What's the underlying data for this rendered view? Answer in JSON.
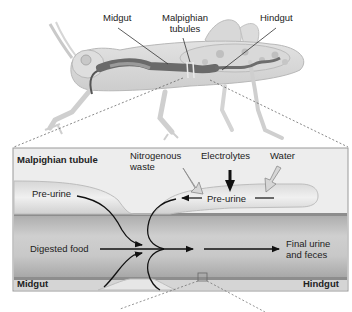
{
  "figure": {
    "top_panel": {
      "subject": "grasshopper",
      "labels": {
        "midgut": "Midgut",
        "malpighian_line1": "Malpighian",
        "malpighian_line2": "tubules",
        "hindgut": "Hindgut"
      }
    },
    "detail_panel": {
      "title": "Malpighian tubule",
      "inputs": {
        "nitrogenous_line1": "Nitrogenous",
        "nitrogenous_line2": "waste",
        "electrolytes": "Electrolytes",
        "water": "Water"
      },
      "pre_urine_left": "Pre-urine",
      "pre_urine_tubule": "Pre-urine",
      "digested_food": "Digested food",
      "final_line1": "Final urine",
      "final_line2": "and feces",
      "midgut": "Midgut",
      "hindgut": "Hindgut"
    },
    "colors": {
      "panel_bg": "#eeeeee",
      "tubule_fill": "#e6e6e6",
      "gut_fill": "#bdbdbd",
      "gut_wall": "#8e8e8e",
      "arrow": "#111111",
      "hollow_arrow": "#d4d4d4"
    }
  }
}
